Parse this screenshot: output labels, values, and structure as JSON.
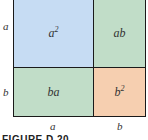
{
  "cells": {
    "a2": {
      "base": "a",
      "exp": "2",
      "color": "#c6dcf3"
    },
    "ab": {
      "text": "ab",
      "color": "#c1ddc8"
    },
    "ba": {
      "text": "ba",
      "color": "#c1ddc8"
    },
    "b2": {
      "base": "b",
      "exp": "2",
      "color": "#f6cfb0"
    }
  },
  "side_labels": {
    "left_top": "a",
    "left_bottom": "b",
    "bottom_left": "a",
    "bottom_right": "b"
  },
  "caption": "FIGURE D.20"
}
